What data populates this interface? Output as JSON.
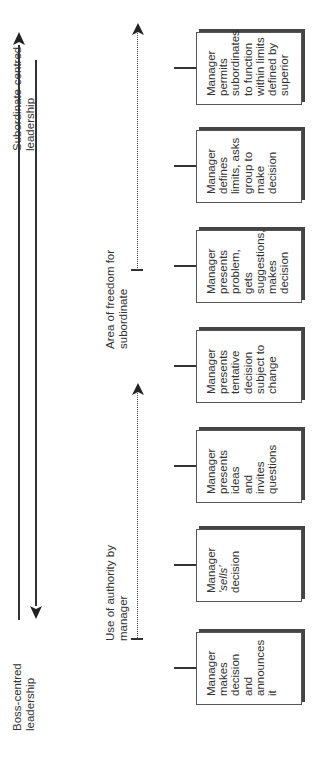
{
  "top_axis": {
    "left_label": [
      "Boss-centred",
      "leadership"
    ],
    "right_label": [
      "Subordinate-centred",
      "leadership"
    ]
  },
  "middle_axis": {
    "authority_label": [
      "Use of authority by",
      "manager"
    ],
    "freedom_label": [
      "Area of freedom for",
      "subordinate"
    ]
  },
  "boxes": [
    {
      "lines": [
        "Manager",
        "makes",
        "decision",
        "and",
        "announces",
        "it"
      ]
    },
    {
      "lines": [
        "Manager",
        "'sells'",
        "decision"
      ]
    },
    {
      "lines": [
        "Manager",
        "presents",
        "ideas",
        "and",
        "invites",
        "questions"
      ]
    },
    {
      "lines": [
        "Manager",
        "presents",
        "tentative",
        "decision",
        "subject to",
        "change"
      ]
    },
    {
      "lines": [
        "Manager",
        "presents",
        "problem,",
        "gets",
        "suggestions,",
        "makes",
        "decision"
      ]
    },
    {
      "lines": [
        "Manager",
        "defines",
        "limits, asks",
        "group to",
        "make",
        "decision"
      ]
    },
    {
      "lines": [
        "Manager",
        "permits",
        "subordinates",
        "to function",
        "within limits",
        "defined by",
        "superior"
      ]
    }
  ],
  "colors": {
    "line": "#333333",
    "shadow": "#444444",
    "background": "#ffffff"
  }
}
